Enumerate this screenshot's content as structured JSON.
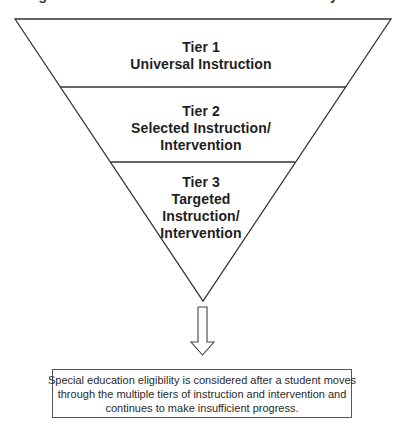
{
  "header": {
    "cut_off_title": "Figure: Tiers of Instruction and Intervention Pyramid"
  },
  "pyramid": {
    "type": "inverted-triangle",
    "stroke_color": "#333333",
    "tiers": [
      {
        "name": "Tier 1",
        "label_lines": [
          "Tier 1",
          "Universal Instruction"
        ]
      },
      {
        "name": "Tier 2",
        "label_lines": [
          "Tier 2",
          "Selected Instruction/",
          "Intervention"
        ]
      },
      {
        "name": "Tier 3",
        "label_lines": [
          "Tier 3",
          "Targeted",
          "Instruction/",
          "Intervention"
        ]
      }
    ]
  },
  "arrow": {
    "direction": "down",
    "icon": "hollow-down-arrow-icon"
  },
  "note": {
    "lines": [
      "Special education eligibility is considered after a student moves",
      "through the multiple tiers of instruction and intervention and",
      "continues to make insufficient progress."
    ]
  }
}
